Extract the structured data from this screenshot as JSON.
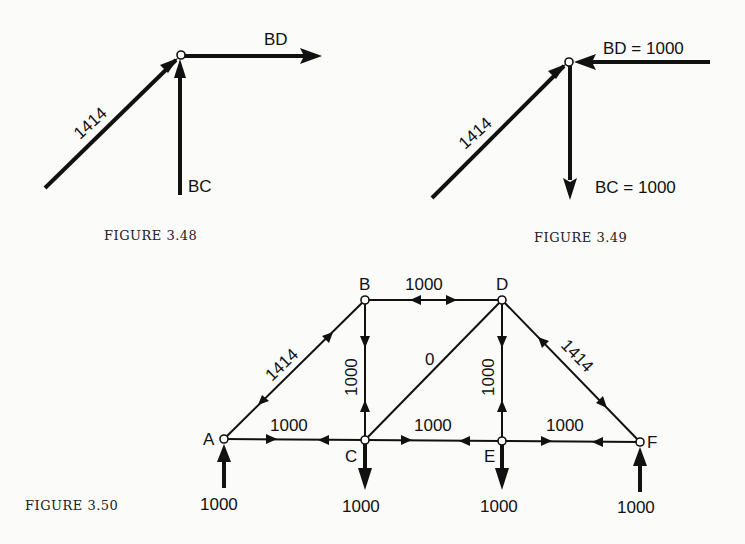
{
  "figures": [
    {
      "id": "fig-3-48",
      "caption": "FIGURE 3.48",
      "labels": {
        "diagonal": "1414",
        "horizontal": "BD",
        "vertical": "BC"
      }
    },
    {
      "id": "fig-3-49",
      "caption": "FIGURE 3.49",
      "labels": {
        "diagonal": "1414",
        "horizontal": "BD = 1000",
        "vertical": "BC = 1000"
      }
    },
    {
      "id": "fig-3-50",
      "caption": "FIGURE 3.50",
      "nodes": [
        "A",
        "B",
        "C",
        "D",
        "E",
        "F"
      ],
      "members": [
        {
          "from": "A",
          "to": "B",
          "force": "1414"
        },
        {
          "from": "B",
          "to": "D",
          "force": "1000"
        },
        {
          "from": "B",
          "to": "C",
          "force": "1000"
        },
        {
          "from": "C",
          "to": "D",
          "force": "0"
        },
        {
          "from": "D",
          "to": "E",
          "force": "1000"
        },
        {
          "from": "D",
          "to": "F",
          "force": "1414"
        },
        {
          "from": "A",
          "to": "C",
          "force": "1000"
        },
        {
          "from": "C",
          "to": "E",
          "force": "1000"
        },
        {
          "from": "E",
          "to": "F",
          "force": "1000"
        }
      ],
      "loads": [
        {
          "node": "A",
          "value": "1000",
          "direction": "up"
        },
        {
          "node": "C",
          "value": "1000",
          "direction": "down"
        },
        {
          "node": "E",
          "value": "1000",
          "direction": "down"
        },
        {
          "node": "F",
          "value": "1000",
          "direction": "up"
        }
      ]
    }
  ]
}
